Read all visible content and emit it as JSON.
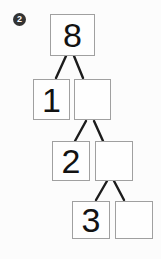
{
  "exercise": {
    "badge": {
      "number": "2"
    },
    "tree": {
      "type": "number-decomposition-tree",
      "root": {
        "value": "8"
      },
      "rows": [
        {
          "left": "1",
          "right": ""
        },
        {
          "left": "2",
          "right": ""
        },
        {
          "left": "3",
          "right": ""
        }
      ]
    }
  },
  "colors": {
    "background": "#fcfcfc",
    "box_border": "#a0a0a0",
    "connector_line": "#1c1c1c",
    "digit": "#121212",
    "badge_background": "#333333",
    "badge_text": "#ffffff"
  }
}
